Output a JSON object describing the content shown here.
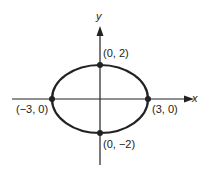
{
  "diagram": {
    "type": "ellipse-graph",
    "equation_implied": "x^2/9 + y^2/4 = 1",
    "axes": {
      "x_label": "x",
      "y_label": "y"
    },
    "points": [
      {
        "label": "(0, 2)",
        "x": 0,
        "y": 2
      },
      {
        "label": "(−3, 0)",
        "x": -3,
        "y": 0
      },
      {
        "label": "(3, 0)",
        "x": 3,
        "y": 0
      },
      {
        "label": "(0, −2)",
        "x": 0,
        "y": -2
      }
    ],
    "colors": {
      "stroke": "#222222",
      "background": "#ffffff"
    }
  }
}
